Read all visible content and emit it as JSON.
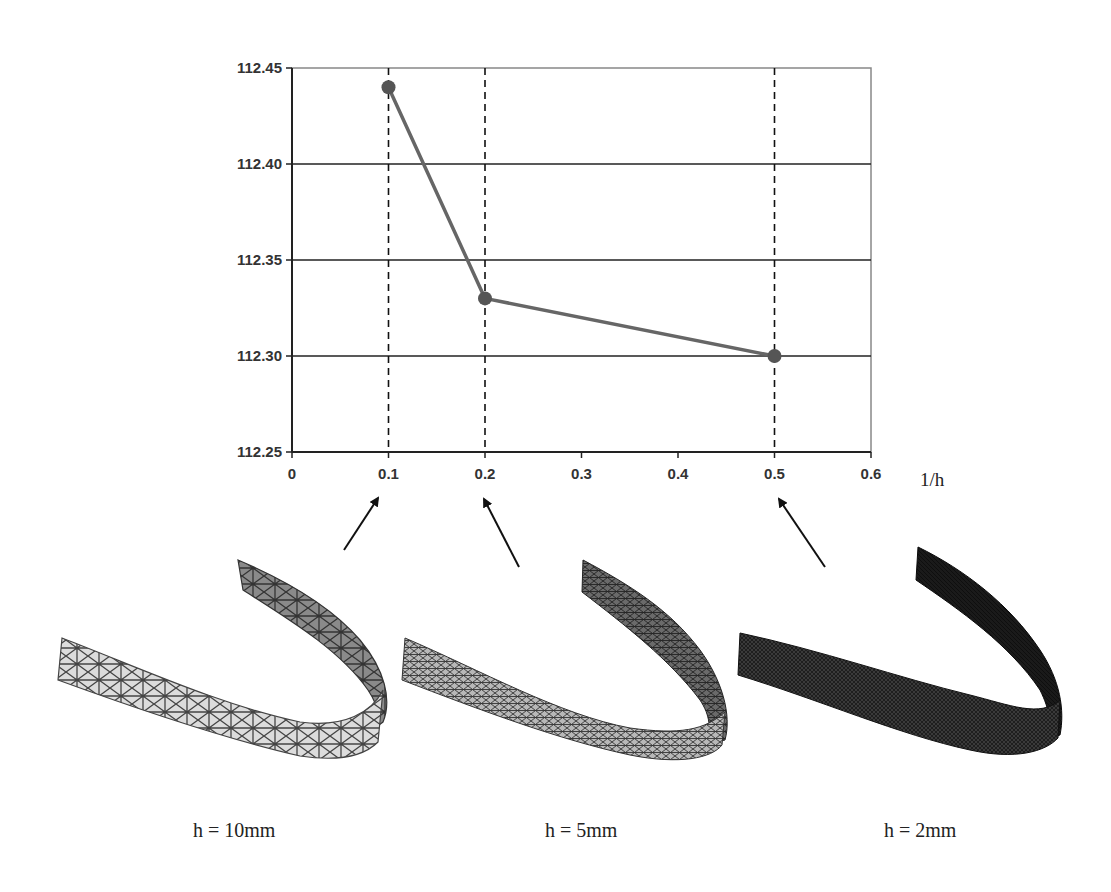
{
  "chart_data": {
    "type": "line",
    "title": "",
    "xlabel": "1/h",
    "ylabel": "",
    "xlim": [
      0,
      0.6
    ],
    "ylim": [
      112.25,
      112.45
    ],
    "grid": {
      "horizontal": true,
      "vertical_dashed_at": [
        0.1,
        0.2,
        0.5
      ]
    },
    "x_ticks": [
      "0",
      "0.1",
      "0.2",
      "0.3",
      "0.4",
      "0.5",
      "0.6"
    ],
    "y_ticks": [
      "112.25",
      "112.30",
      "112.35",
      "112.40",
      "112.45"
    ],
    "series": [
      {
        "name": "convergence",
        "x": [
          0.1,
          0.2,
          0.5
        ],
        "y": [
          112.44,
          112.33,
          112.3
        ],
        "color": "#666666",
        "marker_color": "#555555"
      }
    ],
    "legend": null
  },
  "annotations": {
    "arrows": [
      {
        "points_to": "0.1",
        "mesh": "h = 10mm"
      },
      {
        "points_to": "0.2",
        "mesh": "h = 5mm"
      },
      {
        "points_to": "0.5",
        "mesh": "h = 2mm"
      }
    ]
  },
  "meshes": [
    {
      "caption": "h = 10mm",
      "density": "coarse",
      "fill": "#d8d8d8",
      "line": "#444444"
    },
    {
      "caption": "h = 5mm",
      "density": "medium",
      "fill": "#b0b0b0",
      "line": "#333333"
    },
    {
      "caption": "h = 2mm",
      "density": "fine",
      "fill": "#2a2a2a",
      "line": "#111111"
    }
  ]
}
